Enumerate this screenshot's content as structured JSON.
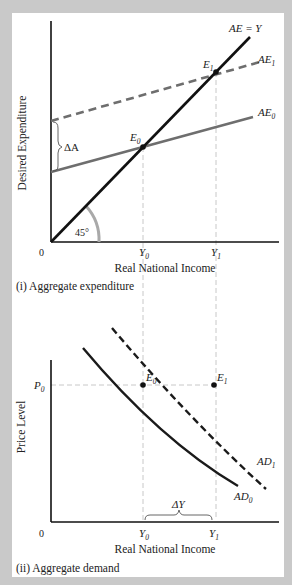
{
  "panels": [
    {
      "caption": "(i) Aggregate expenditure",
      "y_axis_label": "Desired Expenditure",
      "x_axis_label": "Real National Income",
      "origin_label": "0",
      "x_ticks": [
        {
          "main": "Y",
          "sub": "0"
        },
        {
          "main": "Y",
          "sub": "1"
        }
      ],
      "lines": {
        "ae_y": "AE = Y",
        "ae1": {
          "main": "AE",
          "sub": "1"
        },
        "ae0": {
          "main": "AE",
          "sub": "0"
        }
      },
      "points": [
        {
          "main": "E",
          "sub": "0"
        },
        {
          "main": "E",
          "sub": "1"
        }
      ],
      "shift_label": "ΔA",
      "angle_label": "45°"
    },
    {
      "caption": "(ii) Aggregate demand",
      "y_axis_label": "Price Level",
      "x_axis_label": "Real National Income",
      "origin_label": "0",
      "y_tick": {
        "main": "P",
        "sub": "0"
      },
      "x_ticks": [
        {
          "main": "Y",
          "sub": "0"
        },
        {
          "main": "Y",
          "sub": "1"
        }
      ],
      "curves": {
        "ad0": {
          "main": "AD",
          "sub": "0"
        },
        "ad1": {
          "main": "AD",
          "sub": "1"
        }
      },
      "points": [
        {
          "main": "E",
          "sub": "0"
        },
        {
          "main": "E",
          "sub": "1"
        }
      ],
      "shift_label": "ΔY"
    }
  ],
  "colors": {
    "frame": "#c9c9c9",
    "panel": "#ffffff",
    "axis": "#111111",
    "ae_y_line": "#111111",
    "ae0_line": "#6e6e6e",
    "ae1_line": "#6e6e6e",
    "ad_curves": "#1a1a1a",
    "guide_lines": "#c8c8c8",
    "angle_arc": "#a9a9a9"
  }
}
